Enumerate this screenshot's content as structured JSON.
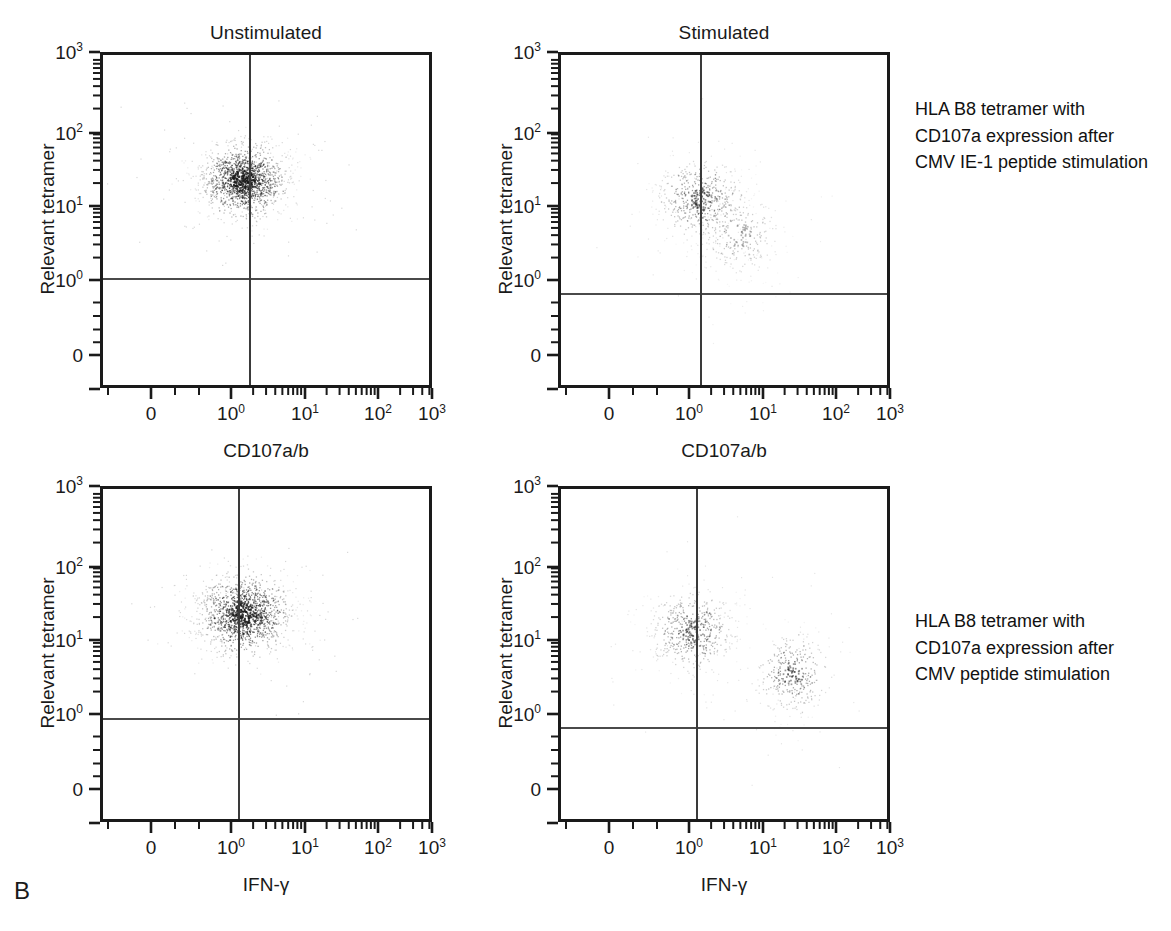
{
  "figure": {
    "letter": "B",
    "caption_panels": 4
  },
  "panels": [
    {
      "id": "top-left",
      "title": "Unstimulated",
      "xlabel": "CD107a/b",
      "ylabel": "Relevant tetramer",
      "xticks": [
        "0",
        "10⁰",
        "10¹",
        "10²",
        "10³"
      ],
      "yticks": [
        "0",
        "10⁰",
        "10¹",
        "10²",
        "10³"
      ]
    },
    {
      "id": "top-right",
      "title": "Stimulated",
      "xlabel": "CD107a/b",
      "ylabel": "Relevant tetramer",
      "xticks": [
        "0",
        "10⁰",
        "10¹",
        "10²",
        "10³"
      ],
      "yticks": [
        "0",
        "10⁰",
        "10¹",
        "10²",
        "10³"
      ]
    },
    {
      "id": "bottom-left",
      "title": "",
      "xlabel": "IFN-γ",
      "ylabel": "Relevant tetramer",
      "xticks": [
        "0",
        "10⁰",
        "10¹",
        "10²",
        "10³"
      ],
      "yticks": [
        "0",
        "10⁰",
        "10¹",
        "10²",
        "10³"
      ]
    },
    {
      "id": "bottom-right",
      "title": "",
      "xlabel": "IFN-γ",
      "ylabel": "Relevant tetramer",
      "xticks": [
        "0",
        "10⁰",
        "10¹",
        "10²",
        "10³"
      ],
      "yticks": [
        "0",
        "10⁰",
        "10¹",
        "10²",
        "10³"
      ]
    }
  ],
  "annotations": [
    {
      "id": "annotation-top",
      "text": "HLA B8 tetramer with\nCD107a expression after\nCMV IE-1 peptide stimulation"
    },
    {
      "id": "annotation-bottom",
      "text": "HLA B8 tetramer with\nCD107a expression after\nCMV peptide stimulation"
    }
  ],
  "chart_data": {
    "type": "scatter",
    "title": "HLA B8 tetramer with CD107a expression after CMV peptide stimulation",
    "layout": "2x2 flow cytometry dot plots",
    "axis_scale": "log (4-decade, 0 to 10^3)",
    "grid": false,
    "legend": "none",
    "xlim": [
      0,
      1000
    ],
    "ylim": [
      0,
      1000
    ],
    "plots": [
      {
        "name": "Unstimulated CD107a/b vs Relevant tetramer",
        "xlabel": "CD107a/b",
        "ylabel": "Relevant tetramer",
        "title": "Unstimulated",
        "quadrant_gate_x": 3.4,
        "quadrant_gate_y": 1.3,
        "clusters": [
          {
            "label": "tetramer+ CD107a-",
            "cx": 1.5,
            "cy": 22,
            "sx": 0.3,
            "sy": 0.22,
            "n": 1300,
            "density": "high"
          }
        ]
      },
      {
        "name": "Stimulated CD107a/b vs Relevant tetramer",
        "xlabel": "CD107a/b",
        "ylabel": "Relevant tetramer",
        "title": "Stimulated",
        "quadrant_gate_x": 3.3,
        "quadrant_gate_y": 0.85,
        "clusters": [
          {
            "label": "tetramer+ CD107a-",
            "cx": 1.4,
            "cy": 12,
            "sx": 0.3,
            "sy": 0.26,
            "n": 520,
            "density": "medium"
          },
          {
            "label": "tetramer+ CD107a+",
            "cx": 5.0,
            "cy": 4.0,
            "sx": 0.28,
            "sy": 0.3,
            "n": 260,
            "density": "low"
          }
        ]
      },
      {
        "name": "Unstimulated IFN-gamma vs Relevant tetramer",
        "xlabel": "IFN-γ",
        "ylabel": "Relevant tetramer",
        "title": "",
        "quadrant_gate_x": 2.6,
        "quadrant_gate_y": 1.25,
        "clusters": [
          {
            "label": "tetramer+ IFN-gamma-",
            "cx": 1.5,
            "cy": 22,
            "sx": 0.32,
            "sy": 0.24,
            "n": 1250,
            "density": "high"
          }
        ]
      },
      {
        "name": "Stimulated IFN-gamma vs Relevant tetramer",
        "xlabel": "IFN-γ",
        "ylabel": "Relevant tetramer",
        "title": "",
        "quadrant_gate_x": 2.6,
        "quadrant_gate_y": 0.85,
        "clusters": [
          {
            "label": "tetramer+ IFN-gamma-",
            "cx": 1.1,
            "cy": 13,
            "sx": 0.3,
            "sy": 0.26,
            "n": 520,
            "density": "medium"
          },
          {
            "label": "tetramer+ IFN-gamma+",
            "cx": 26,
            "cy": 3.5,
            "sx": 0.24,
            "sy": 0.28,
            "n": 330,
            "density": "medium"
          }
        ]
      }
    ]
  }
}
